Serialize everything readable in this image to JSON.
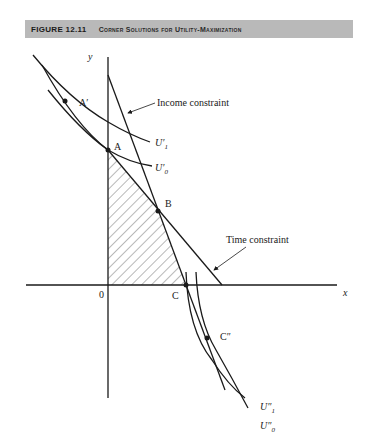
{
  "caption": {
    "figure_number": "FIGURE 12.11",
    "title": "Corner Solutions for Utility-Maximization"
  },
  "axes": {
    "x_label": "x",
    "y_label": "y",
    "origin_label": "0"
  },
  "points": {
    "A_prime": "A′",
    "A": "A",
    "B": "B",
    "C": "C",
    "C_double_prime": "C″"
  },
  "curves": {
    "U1_prime": "U′",
    "U0_prime": "U′",
    "U1_double_prime": "U″",
    "U0_double_prime": "U″",
    "sub1": "1",
    "sub0": "0"
  },
  "annotations": {
    "income_constraint": "Income constraint",
    "time_constraint": "Time constraint"
  },
  "colors": {
    "caption_bar": "#b9b9b9",
    "ink": "#1a1a1a"
  }
}
